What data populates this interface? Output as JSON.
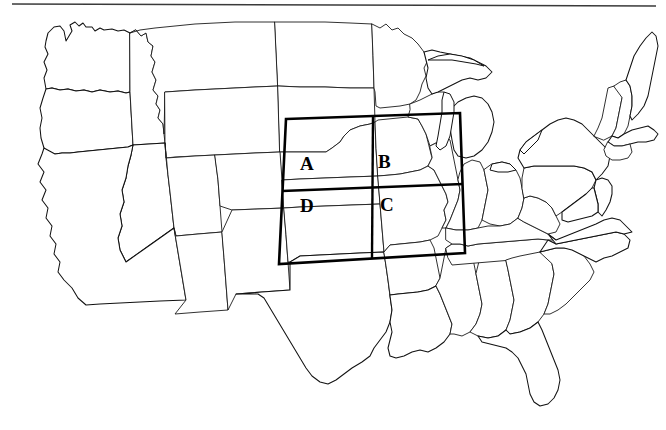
{
  "figure": {
    "width": 666,
    "height": 430,
    "background_color": "#ffffff",
    "outline_color": "#111111",
    "grid_color": "#000000",
    "top_frame_color": "#3a3a3a"
  },
  "grid_overlay": {
    "name": "study-area-grid",
    "rows": 2,
    "columns": 2,
    "stroke_width_px": 2.6,
    "corners": {
      "top_left": [
        286,
        119
      ],
      "top_right": [
        460,
        113
      ],
      "bottom_right": [
        465,
        253
      ],
      "bottom_left": [
        279,
        264
      ]
    },
    "center_intersection": [
      371,
      185
    ],
    "quadrants": [
      {
        "id": "A",
        "label": "A",
        "position": "upper-left",
        "x": 300,
        "y": 154
      },
      {
        "id": "B",
        "label": "B",
        "position": "upper-right",
        "x": 378,
        "y": 152
      },
      {
        "id": "D",
        "label": "D",
        "position": "lower-left",
        "x": 300,
        "y": 196
      },
      {
        "id": "C",
        "label": "C",
        "position": "lower-right",
        "x": 380,
        "y": 195
      }
    ]
  },
  "map_content": {
    "region": "Contiguous United States",
    "features_shown": [
      "state-boundaries",
      "national-coastline",
      "great-lakes",
      "gulf-coast",
      "atlantic-coast",
      "pacific-coast"
    ],
    "labels_shown": [
      "A",
      "B",
      "C",
      "D"
    ],
    "state_labels_shown": "none"
  }
}
